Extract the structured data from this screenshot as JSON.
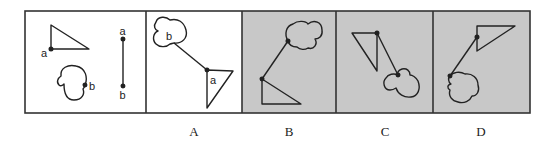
{
  "puzzle": {
    "question_panel": {
      "labels": {
        "triangle_point": "a",
        "cloud_point": "b",
        "line_top": "a",
        "line_bottom": "b"
      }
    },
    "options": [
      {
        "label": "A",
        "inner_labels": {
          "cloud_point": "b",
          "triangle_point": "a"
        },
        "background": "white"
      },
      {
        "label": "B",
        "background": "gray"
      },
      {
        "label": "C",
        "background": "gray"
      },
      {
        "label": "D",
        "background": "gray"
      }
    ]
  },
  "colors": {
    "stroke": "#222222",
    "frame": "#333333",
    "gray_fill": "#c8c8c8",
    "white_fill": "#ffffff"
  }
}
